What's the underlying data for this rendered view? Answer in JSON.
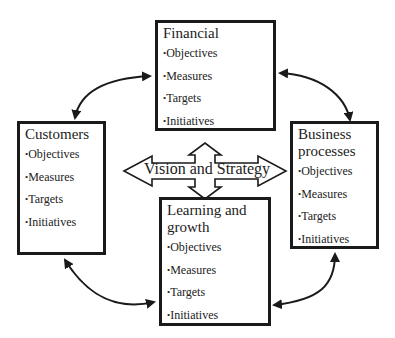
{
  "diagram": {
    "center": {
      "label": "Vision and Strategy",
      "icon": "four-way-arrow-icon"
    },
    "perspectives": [
      {
        "id": "financial",
        "title": "Financial",
        "items": [
          "Objectives",
          "Measures",
          "Targets",
          "Initiatives"
        ]
      },
      {
        "id": "customers",
        "title": "Customers",
        "items": [
          "Objectives",
          "Measures",
          "Targets",
          "Initiatives"
        ]
      },
      {
        "id": "business",
        "title": "Business processes",
        "items": [
          "Objectives",
          "Measures",
          "Targets",
          "Initiatives"
        ]
      },
      {
        "id": "learning",
        "title": "Learning and growth",
        "items": [
          "Objectives",
          "Measures",
          "Targets",
          "Initiatives"
        ]
      }
    ],
    "connections": [
      {
        "from": "customers",
        "to": "financial",
        "type": "bidirectional-curved"
      },
      {
        "from": "financial",
        "to": "business",
        "type": "bidirectional-curved"
      },
      {
        "from": "customers",
        "to": "learning",
        "type": "bidirectional-curved"
      },
      {
        "from": "learning",
        "to": "business",
        "type": "bidirectional-curved"
      }
    ],
    "colors": {
      "stroke": "#1a1a1a",
      "background": "#ffffff",
      "text": "#222222"
    }
  }
}
